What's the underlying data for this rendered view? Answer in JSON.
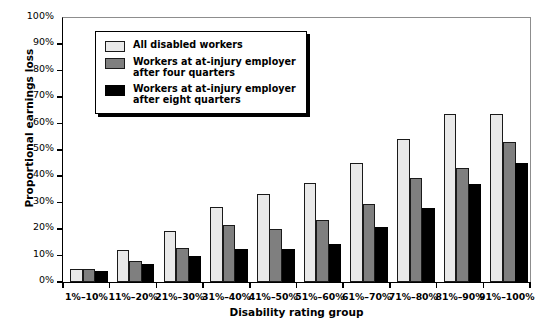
{
  "chart_data": {
    "type": "bar",
    "title": "",
    "xlabel": "Disability rating group",
    "ylabel": "Proportional earnings loss",
    "categories": [
      "1%–10%",
      "11%–20%",
      "21%–30%",
      "31%–40%",
      "41%–50%",
      "51%–60%",
      "61%–70%",
      "71%–80%",
      "81%–90%",
      "91%–100%"
    ],
    "series": [
      {
        "name": "All disabled workers",
        "color": "#e9e9e9",
        "values": [
          5,
          12,
          19.5,
          28.5,
          33.5,
          37.5,
          45,
          54,
          63.5,
          63.5
        ]
      },
      {
        "name": "Workers at at-injury employer\nafter four quarters",
        "color": "#7f7f7f",
        "values": [
          5,
          8,
          13,
          21.5,
          20,
          23.5,
          29.5,
          39.5,
          43,
          53
        ]
      },
      {
        "name": "Workers at at-injury employer\nafter eight quarters",
        "color": "#000000",
        "values": [
          4,
          7,
          10,
          12.5,
          12.5,
          14.5,
          21,
          28,
          37,
          45
        ]
      }
    ],
    "ylim": [
      0,
      100
    ],
    "yticks": [
      "0%",
      "10%",
      "20%",
      "30%",
      "40%",
      "50%",
      "60%",
      "70%",
      "80%",
      "90%",
      "100%"
    ],
    "ytick_values": [
      0,
      10,
      20,
      30,
      40,
      50,
      60,
      70,
      80,
      90,
      100
    ],
    "grid": false,
    "legend_position": "top-left"
  }
}
